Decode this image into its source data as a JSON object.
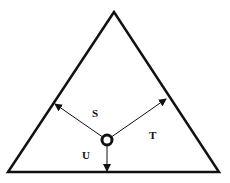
{
  "diagram": {
    "type": "triangle-with-interior-point-perpendiculars",
    "colors": {
      "stroke": "#111111",
      "background": "#ffffff"
    },
    "triangle": {
      "apex": [
        114,
        12
      ],
      "bottom_left": [
        8,
        172
      ],
      "bottom_right": [
        219,
        172
      ]
    },
    "center_point": [
      107,
      140
    ],
    "arrows": [
      {
        "id": "S",
        "to": [
          55,
          104
        ]
      },
      {
        "id": "T",
        "to": [
          166,
          99
        ]
      },
      {
        "id": "U",
        "to": [
          107,
          171
        ]
      }
    ],
    "labels": {
      "s": "S",
      "t": "T",
      "u": "U"
    }
  }
}
